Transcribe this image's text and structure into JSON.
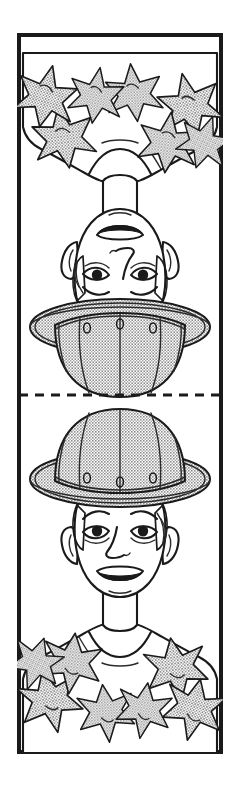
{
  "image": {
    "title": "Boy with pith helmet and flower lei",
    "kind": "line-art-illustration",
    "background_color": "#ffffff"
  },
  "frame": {
    "name": "artboard-border",
    "stroke_color": "#1a1a1a",
    "fill_color": "#ffffff",
    "x": 17,
    "y": 33,
    "width": 206,
    "height": 721
  },
  "fold_line": {
    "name": "dashed-fold-line",
    "style": "dashed",
    "stroke_color": "#1a1a1a",
    "y": 395,
    "label": ""
  },
  "panels": [
    {
      "id": "top-panel",
      "orientation": "rotated-180",
      "label": "",
      "subject": "boy-with-helmet-and-lei"
    },
    {
      "id": "bottom-panel",
      "orientation": "upright",
      "label": "",
      "subject": "boy-with-helmet-and-lei"
    }
  ],
  "figure": {
    "name": "boy-figure",
    "parts": {
      "helmet": {
        "name": "pith-helmet",
        "fill_color": "#b9b9b9",
        "outline_color": "#1a1a1a",
        "seam_count": 5,
        "grommet_count": 3
      },
      "face": {
        "name": "face",
        "fill_color": "#ffffff",
        "features": [
          "eyebrows",
          "eyes",
          "pupils",
          "nose",
          "mouth",
          "ears"
        ]
      },
      "hair": {
        "name": "hair",
        "outline_color": "#1a1a1a"
      },
      "shirt": {
        "name": "t-shirt",
        "fill_color": "#ffffff",
        "outline_color": "#1a1a1a"
      },
      "lei": {
        "name": "flower-lei",
        "fill_color": "#b9b9b9",
        "outline_color": "#1a1a1a",
        "flower_count": 7,
        "petals_per_flower": 6
      }
    }
  },
  "colors": {
    "ink": "#1a1a1a",
    "gray": "#b9b9b9",
    "paper": "#ffffff"
  }
}
